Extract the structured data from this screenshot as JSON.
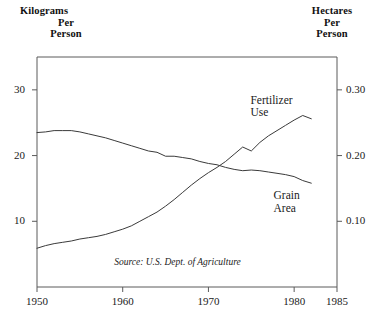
{
  "axes": {
    "left_title_lines": [
      "Kilograms",
      "Per",
      "Person"
    ],
    "right_title_lines": [
      "Hectares",
      "Per",
      "Person"
    ],
    "left_ticks": [
      "30",
      "20",
      "10"
    ],
    "right_ticks": [
      "0.30",
      "0.20",
      "0.10"
    ],
    "x_ticks": [
      "1950",
      "1960",
      "1970",
      "1980",
      "1985"
    ]
  },
  "labels": {
    "fertilizer_line1": "Fertilizer",
    "fertilizer_line2": "Use",
    "grain_line1": "Grain",
    "grain_line2": "Area"
  },
  "source": "Source: U.S. Dept. of Agriculture",
  "colors": {
    "line": "#3a3a3a",
    "axis": "#5a5a5a",
    "text": "#1a1a1a",
    "background": "#ffffff"
  },
  "chart_data": {
    "type": "line",
    "title": "",
    "subtitle": "",
    "xlabel": "",
    "ylabel": "Kilograms Per Person",
    "y2label": "Hectares Per Person",
    "xlim": [
      1950,
      1985
    ],
    "ylim": [
      0,
      35
    ],
    "y2lim": [
      0.0,
      0.35
    ],
    "grid": false,
    "legend": "inline-annotations",
    "x_tick_values": [
      1950,
      1960,
      1970,
      1980,
      1985
    ],
    "y_tick_values": [
      10,
      20,
      30
    ],
    "y2_tick_values": [
      0.1,
      0.2,
      0.3
    ],
    "annotations": [
      {
        "text": "Fertilizer Use",
        "series": "Fertilizer Use",
        "x": 1977,
        "y": 28.5
      },
      {
        "text": "Grain Area",
        "series": "Grain Area",
        "x": 1979,
        "y": 14.0
      },
      {
        "text": "Source: U.S. Dept. of Agriculture",
        "x": 1966,
        "y": 3.6
      }
    ],
    "series": [
      {
        "name": "Fertilizer Use",
        "axis": "left",
        "unit": "kilograms per person",
        "x": [
          1950,
          1951,
          1952,
          1953,
          1954,
          1955,
          1956,
          1957,
          1958,
          1959,
          1960,
          1961,
          1962,
          1963,
          1964,
          1965,
          1966,
          1967,
          1968,
          1969,
          1970,
          1971,
          1972,
          1973,
          1974,
          1975,
          1976,
          1977,
          1978,
          1979,
          1980,
          1981,
          1982
        ],
        "values": [
          5.9,
          6.3,
          6.6,
          6.8,
          7.0,
          7.3,
          7.5,
          7.7,
          8.0,
          8.4,
          8.8,
          9.3,
          10.0,
          10.7,
          11.4,
          12.3,
          13.3,
          14.4,
          15.5,
          16.5,
          17.4,
          18.2,
          19.1,
          20.2,
          21.3,
          20.7,
          22.0,
          23.0,
          23.8,
          24.6,
          25.4,
          26.1,
          25.6
        ]
      },
      {
        "name": "Grain Area",
        "axis": "right",
        "unit": "hectares per person",
        "x": [
          1950,
          1951,
          1952,
          1953,
          1954,
          1955,
          1956,
          1957,
          1958,
          1959,
          1960,
          1961,
          1962,
          1963,
          1964,
          1965,
          1966,
          1967,
          1968,
          1969,
          1970,
          1971,
          1972,
          1973,
          1974,
          1975,
          1976,
          1977,
          1978,
          1979,
          1980,
          1981,
          1982
        ],
        "values_right_axis": [
          0.235,
          0.236,
          0.238,
          0.238,
          0.238,
          0.236,
          0.233,
          0.23,
          0.227,
          0.223,
          0.219,
          0.215,
          0.211,
          0.207,
          0.205,
          0.199,
          0.199,
          0.197,
          0.195,
          0.191,
          0.188,
          0.186,
          0.182,
          0.179,
          0.177,
          0.178,
          0.177,
          0.175,
          0.173,
          0.171,
          0.168,
          0.162,
          0.158
        ],
        "values_left_equivalent": [
          23.5,
          23.6,
          23.8,
          23.8,
          23.8,
          23.6,
          23.3,
          23.0,
          22.7,
          22.3,
          21.9,
          21.5,
          21.1,
          20.7,
          20.5,
          19.9,
          19.9,
          19.7,
          19.5,
          19.1,
          18.8,
          18.6,
          18.2,
          17.9,
          17.7,
          17.8,
          17.7,
          17.5,
          17.3,
          17.1,
          16.8,
          16.2,
          15.8
        ]
      }
    ]
  }
}
